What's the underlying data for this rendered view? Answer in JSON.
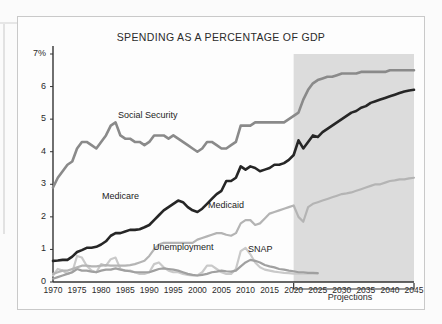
{
  "figure": {
    "title": "SPENDING AS A PERCENTAGE OF GDP",
    "projections_label": "Projections"
  },
  "axes": {
    "y_ticks": [
      "7%",
      "6",
      "5",
      "4",
      "3",
      "2",
      "1",
      "0"
    ],
    "x_ticks": [
      "1970",
      "1975",
      "1980",
      "1985",
      "1990",
      "1995",
      "2000",
      "2005",
      "2010",
      "2015",
      "2020",
      "2025",
      "2030",
      "2035",
      "2040",
      "2045"
    ]
  },
  "series_labels": {
    "social_security": "Social Security",
    "medicare": "Medicare",
    "medicaid": "Medicaid",
    "unemployment": "Unemployment",
    "snap": "SNAP"
  },
  "colors": {
    "social_security": "#8a8a8a",
    "medicare": "#262626",
    "medicaid": "#b4b4b4",
    "unemployment": "#c9c9c9",
    "snap": "#a0a0a0",
    "projection_band": "#dcdcdc",
    "axis": "#333333",
    "frame": "#c9c9c9"
  },
  "chart_data": {
    "type": "line",
    "title": "SPENDING AS A PERCENTAGE OF GDP",
    "xlabel": "",
    "ylabel": "Percentage of GDP",
    "xlim": [
      1970,
      2045
    ],
    "ylim": [
      0,
      7
    ],
    "grid": false,
    "legend": "inline-annotations",
    "annotations": [
      "Social Security",
      "Medicare",
      "Medicaid",
      "Unemployment",
      "SNAP",
      "Projections"
    ],
    "projection_start": 2020,
    "series": [
      {
        "name": "Social Security",
        "color": "#8a8a8a",
        "x": [
          1970,
          1971,
          1972,
          1973,
          1974,
          1975,
          1976,
          1977,
          1978,
          1979,
          1980,
          1981,
          1982,
          1983,
          1984,
          1985,
          1986,
          1987,
          1988,
          1989,
          1990,
          1991,
          1992,
          1993,
          1994,
          1995,
          1996,
          1997,
          1998,
          1999,
          2000,
          2001,
          2002,
          2003,
          2004,
          2005,
          2006,
          2007,
          2008,
          2009,
          2010,
          2011,
          2012,
          2013,
          2014,
          2015,
          2016,
          2017,
          2018,
          2019,
          2020,
          2021,
          2022,
          2023,
          2024,
          2025,
          2026,
          2027,
          2028,
          2029,
          2030,
          2031,
          2032,
          2033,
          2034,
          2035,
          2036,
          2037,
          2038,
          2039,
          2040,
          2041,
          2042,
          2043,
          2044,
          2045
        ],
        "y": [
          2.9,
          3.2,
          3.4,
          3.6,
          3.7,
          4.1,
          4.3,
          4.3,
          4.2,
          4.1,
          4.3,
          4.5,
          4.8,
          4.9,
          4.5,
          4.4,
          4.4,
          4.3,
          4.3,
          4.2,
          4.3,
          4.5,
          4.5,
          4.5,
          4.4,
          4.5,
          4.4,
          4.3,
          4.2,
          4.1,
          4.0,
          4.1,
          4.3,
          4.3,
          4.2,
          4.1,
          4.1,
          4.2,
          4.3,
          4.8,
          4.8,
          4.8,
          4.9,
          4.9,
          4.9,
          4.9,
          4.9,
          4.9,
          4.9,
          5.0,
          5.1,
          5.2,
          5.6,
          5.9,
          6.1,
          6.2,
          6.25,
          6.3,
          6.3,
          6.35,
          6.4,
          6.4,
          6.4,
          6.4,
          6.45,
          6.45,
          6.45,
          6.45,
          6.45,
          6.45,
          6.5,
          6.5,
          6.5,
          6.5,
          6.5,
          6.5
        ]
      },
      {
        "name": "Medicare",
        "color": "#262626",
        "x": [
          1970,
          1971,
          1972,
          1973,
          1974,
          1975,
          1976,
          1977,
          1978,
          1979,
          1980,
          1981,
          1982,
          1983,
          1984,
          1985,
          1986,
          1987,
          1988,
          1989,
          1990,
          1991,
          1992,
          1993,
          1994,
          1995,
          1996,
          1997,
          1998,
          1999,
          2000,
          2001,
          2002,
          2003,
          2004,
          2005,
          2006,
          2007,
          2008,
          2009,
          2010,
          2011,
          2012,
          2013,
          2014,
          2015,
          2016,
          2017,
          2018,
          2019,
          2020,
          2021,
          2022,
          2023,
          2024,
          2025,
          2026,
          2027,
          2028,
          2029,
          2030,
          2031,
          2032,
          2033,
          2034,
          2035,
          2036,
          2037,
          2038,
          2039,
          2040,
          2041,
          2042,
          2043,
          2044,
          2045
        ],
        "y": [
          0.65,
          0.66,
          0.68,
          0.68,
          0.78,
          0.92,
          0.98,
          1.05,
          1.05,
          1.08,
          1.15,
          1.25,
          1.42,
          1.5,
          1.5,
          1.55,
          1.6,
          1.6,
          1.62,
          1.68,
          1.75,
          1.9,
          2.05,
          2.2,
          2.3,
          2.4,
          2.5,
          2.45,
          2.3,
          2.2,
          2.15,
          2.25,
          2.4,
          2.55,
          2.7,
          2.8,
          3.1,
          3.1,
          3.2,
          3.55,
          3.45,
          3.55,
          3.5,
          3.4,
          3.45,
          3.5,
          3.6,
          3.6,
          3.65,
          3.75,
          3.9,
          4.35,
          4.1,
          4.3,
          4.5,
          4.45,
          4.6,
          4.7,
          4.8,
          4.9,
          5.0,
          5.1,
          5.2,
          5.25,
          5.35,
          5.4,
          5.5,
          5.55,
          5.6,
          5.65,
          5.7,
          5.75,
          5.8,
          5.85,
          5.88,
          5.9
        ]
      },
      {
        "name": "Medicaid",
        "color": "#b4b4b4",
        "x": [
          1970,
          1971,
          1972,
          1973,
          1974,
          1975,
          1976,
          1977,
          1978,
          1979,
          1980,
          1981,
          1982,
          1983,
          1984,
          1985,
          1986,
          1987,
          1988,
          1989,
          1990,
          1991,
          1992,
          1993,
          1994,
          1995,
          1996,
          1997,
          1998,
          1999,
          2000,
          2001,
          2002,
          2003,
          2004,
          2005,
          2006,
          2007,
          2008,
          2009,
          2010,
          2011,
          2012,
          2013,
          2014,
          2015,
          2016,
          2017,
          2018,
          2019,
          2020,
          2021,
          2022,
          2023,
          2024,
          2025,
          2026,
          2027,
          2028,
          2029,
          2030,
          2031,
          2032,
          2033,
          2034,
          2035,
          2036,
          2037,
          2038,
          2039,
          2040,
          2041,
          2042,
          2043,
          2044,
          2045
        ],
        "y": [
          0.25,
          0.3,
          0.35,
          0.35,
          0.4,
          0.45,
          0.5,
          0.5,
          0.48,
          0.48,
          0.5,
          0.52,
          0.5,
          0.5,
          0.5,
          0.5,
          0.52,
          0.55,
          0.6,
          0.65,
          0.8,
          1.0,
          1.15,
          1.2,
          1.2,
          1.2,
          1.2,
          1.2,
          1.2,
          1.2,
          1.3,
          1.35,
          1.4,
          1.45,
          1.5,
          1.5,
          1.45,
          1.42,
          1.5,
          1.8,
          1.9,
          1.9,
          1.75,
          1.8,
          1.95,
          2.1,
          2.15,
          2.2,
          2.25,
          2.3,
          2.35,
          2.0,
          1.85,
          2.3,
          2.4,
          2.45,
          2.5,
          2.55,
          2.6,
          2.65,
          2.7,
          2.72,
          2.75,
          2.8,
          2.85,
          2.9,
          2.95,
          3.0,
          3.0,
          3.05,
          3.1,
          3.12,
          3.15,
          3.15,
          3.18,
          3.2
        ]
      },
      {
        "name": "Unemployment",
        "color": "#c9c9c9",
        "x": [
          1970,
          1971,
          1972,
          1973,
          1974,
          1975,
          1976,
          1977,
          1978,
          1979,
          1980,
          1981,
          1982,
          1983,
          1984,
          1985,
          1986,
          1987,
          1988,
          1989,
          1990,
          1991,
          1992,
          1993,
          1994,
          1995,
          1996,
          1997,
          1998,
          1999,
          2000,
          2001,
          2002,
          2003,
          2004,
          2005,
          2006,
          2007,
          2008,
          2009,
          2010,
          2011,
          2012,
          2013,
          2014,
          2015,
          2016,
          2017,
          2018,
          2019,
          2020,
          2021,
          2022,
          2023,
          2024,
          2025
        ],
        "y": [
          0.2,
          0.4,
          0.35,
          0.25,
          0.3,
          0.8,
          0.75,
          0.5,
          0.35,
          0.3,
          0.55,
          0.5,
          0.7,
          0.75,
          0.4,
          0.35,
          0.35,
          0.3,
          0.25,
          0.25,
          0.3,
          0.55,
          0.6,
          0.45,
          0.35,
          0.3,
          0.3,
          0.25,
          0.22,
          0.2,
          0.2,
          0.3,
          0.5,
          0.5,
          0.4,
          0.3,
          0.25,
          0.25,
          0.4,
          0.95,
          1.05,
          0.85,
          0.6,
          0.45,
          0.38,
          0.35,
          0.32,
          0.3,
          0.28,
          0.27,
          0.26,
          0.26,
          0.26,
          0.26,
          0.26,
          0.26
        ]
      },
      {
        "name": "SNAP",
        "color": "#a0a0a0",
        "x": [
          1970,
          1971,
          1972,
          1973,
          1974,
          1975,
          1976,
          1977,
          1978,
          1979,
          1980,
          1981,
          1982,
          1983,
          1984,
          1985,
          1986,
          1987,
          1988,
          1989,
          1990,
          1991,
          1992,
          1993,
          1994,
          1995,
          1996,
          1997,
          1998,
          1999,
          2000,
          2001,
          2002,
          2003,
          2004,
          2005,
          2006,
          2007,
          2008,
          2009,
          2010,
          2011,
          2012,
          2013,
          2014,
          2015,
          2016,
          2017,
          2018,
          2019,
          2020,
          2021,
          2022,
          2023,
          2024,
          2025
        ],
        "y": [
          0.1,
          0.15,
          0.2,
          0.25,
          0.3,
          0.4,
          0.35,
          0.35,
          0.32,
          0.3,
          0.35,
          0.38,
          0.38,
          0.42,
          0.38,
          0.35,
          0.33,
          0.3,
          0.3,
          0.3,
          0.3,
          0.35,
          0.4,
          0.42,
          0.4,
          0.38,
          0.35,
          0.3,
          0.25,
          0.22,
          0.2,
          0.22,
          0.25,
          0.3,
          0.32,
          0.35,
          0.33,
          0.32,
          0.35,
          0.48,
          0.6,
          0.68,
          0.65,
          0.6,
          0.52,
          0.48,
          0.45,
          0.4,
          0.38,
          0.35,
          0.33,
          0.3,
          0.3,
          0.28,
          0.28,
          0.27
        ]
      }
    ]
  }
}
